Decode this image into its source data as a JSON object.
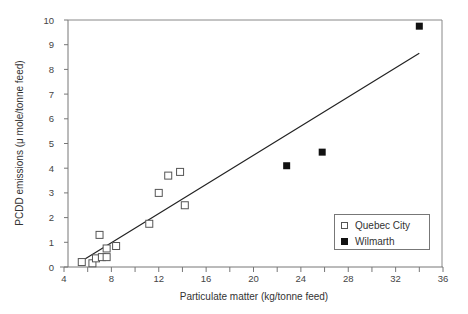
{
  "chart_data": {
    "type": "scatter",
    "title": "",
    "xlabel": "Particulate matter  (kg/tonne feed)",
    "ylabel": "PCDD emissions (μ mole/tonne feed)",
    "xlim": [
      4,
      36
    ],
    "ylim": [
      0,
      10
    ],
    "xticks": [
      4,
      8,
      12,
      16,
      20,
      24,
      28,
      32,
      36
    ],
    "yticks": [
      0,
      1,
      2,
      3,
      4,
      5,
      6,
      7,
      8,
      9,
      10
    ],
    "grid": false,
    "legend_position": "lower right",
    "series": [
      {
        "name": "Quebec City",
        "marker": "open-square",
        "points": [
          [
            5.5,
            0.2
          ],
          [
            6.4,
            0.15
          ],
          [
            6.7,
            0.35
          ],
          [
            7.0,
            1.3
          ],
          [
            7.2,
            0.4
          ],
          [
            7.6,
            0.4
          ],
          [
            7.6,
            0.75
          ],
          [
            8.4,
            0.85
          ],
          [
            11.2,
            1.75
          ],
          [
            12.0,
            3.0
          ],
          [
            12.8,
            3.7
          ],
          [
            13.8,
            3.85
          ],
          [
            14.2,
            2.5
          ]
        ]
      },
      {
        "name": "Wilmarth",
        "marker": "filled-square",
        "points": [
          [
            22.8,
            4.1
          ],
          [
            25.8,
            4.65
          ],
          [
            34.0,
            9.75
          ]
        ]
      }
    ],
    "fit_line": {
      "x": [
        5.7,
        34.0
      ],
      "y": [
        0.3,
        8.65
      ]
    }
  },
  "legend": {
    "items": [
      {
        "label": "Quebec City"
      },
      {
        "label": "Wilmarth"
      }
    ]
  }
}
